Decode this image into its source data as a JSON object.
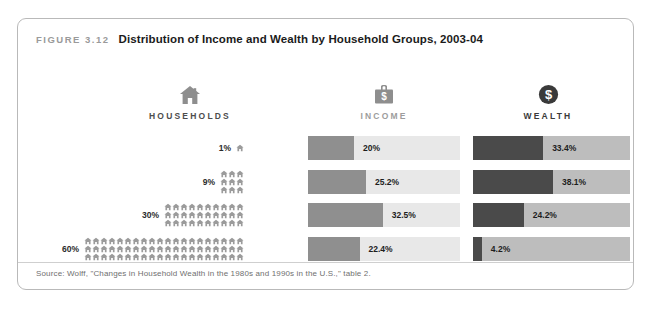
{
  "figure": {
    "label": "FIGURE 3.12",
    "title": "Distribution of Income and Wealth by Household Groups, 2003-04",
    "source": "Source: Wolff, \"Changes in Household Wealth in the 1980s and 1990s in the U.S.,\" table 2."
  },
  "columns": {
    "households": {
      "label": "HOUSEHOLDS",
      "icon": "house-icon"
    },
    "income": {
      "label": "INCOME",
      "icon": "briefcase-dollar-icon"
    },
    "wealth": {
      "label": "WEALTH",
      "icon": "coin-dollar-icon"
    }
  },
  "rows": [
    {
      "group": "1%",
      "houses": 1,
      "income": "20%",
      "wealth": "33.4%"
    },
    {
      "group": "9%",
      "houses": 9,
      "income": "25.2%",
      "wealth": "38.1%"
    },
    {
      "group": "30%",
      "houses": 30,
      "income": "32.5%",
      "wealth": "24.2%"
    },
    {
      "group": "60%",
      "houses": 60,
      "income": "22.4%",
      "wealth": "4.2%"
    }
  ],
  "colors": {
    "income_fill": "#8f8f8f",
    "income_track": "#e8e8e8",
    "wealth_fill": "#4a4a4a",
    "wealth_track": "#bdbdbd",
    "house_icon": "#9b9b9b",
    "frame": "#b9b9b9"
  },
  "chart_data": {
    "type": "bar",
    "title": "Distribution of Income and Wealth by Household Groups, 2003-04",
    "subtitle": "FIGURE 3.12",
    "orientation": "horizontal",
    "categories": [
      "1%",
      "9%",
      "30%",
      "60%"
    ],
    "xlabel": "Household Groups",
    "ylabel": "Share (%)",
    "xlim": [
      0,
      100
    ],
    "grid": false,
    "legend": false,
    "series": [
      {
        "name": "Households",
        "unit": "%",
        "values": [
          1,
          9,
          30,
          60
        ]
      },
      {
        "name": "Income",
        "unit": "%",
        "values": [
          20,
          25.2,
          32.5,
          22.4
        ]
      },
      {
        "name": "Wealth",
        "unit": "%",
        "values": [
          33.4,
          38.1,
          24.2,
          4.2
        ]
      }
    ],
    "annotations": [
      "Each house pictogram represents 1% of households",
      "Bars show each group's percentage share of total income and total wealth"
    ],
    "source": "Wolff, \"Changes in Household Wealth in the 1980s and 1990s in the U.S.,\" table 2."
  }
}
